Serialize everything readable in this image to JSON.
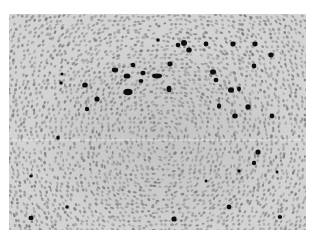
{
  "image": {
    "kind": "grayscale histology micrograph",
    "description": "Tissue section with densely packed small gray nuclei arranged in a roughly circular follicle-like pattern; scattered darkly stained nuclei concentrated in the upper half",
    "frame": {
      "x": 9,
      "y": 14,
      "width": 297,
      "height": 216
    },
    "colors": {
      "border": "#ffffff",
      "background": "#cfcfcf",
      "nucleus_light": "#9a9a9a",
      "nucleus_mid": "#7d7d7d",
      "nucleus_dark": "#111111",
      "scan_line": "#f2f2f2"
    },
    "artifacts": {
      "horizontal_scan_line_y": 140
    },
    "dark_nuclei": [
      [
        115,
        70,
        3.2,
        2.4
      ],
      [
        133,
        65,
        2.4,
        2.2
      ],
      [
        143,
        73,
        2.6,
        2.2
      ],
      [
        141,
        81,
        2.3,
        2.0
      ],
      [
        127,
        76,
        3.4,
        2.6
      ],
      [
        157,
        76,
        5.0,
        2.4
      ],
      [
        169,
        89,
        2.4,
        3.2
      ],
      [
        128,
        92,
        4.6,
        3.2
      ],
      [
        170,
        64,
        2.6,
        2.4
      ],
      [
        189,
        50,
        2.8,
        2.6
      ],
      [
        178,
        45,
        2.4,
        2.2
      ],
      [
        184,
        43,
        3.0,
        3.0
      ],
      [
        206,
        44,
        2.4,
        2.4
      ],
      [
        233,
        44,
        2.6,
        2.4
      ],
      [
        255,
        44,
        2.6,
        2.4
      ],
      [
        271,
        55,
        2.6,
        2.4
      ],
      [
        254,
        66,
        2.4,
        2.4
      ],
      [
        213,
        72,
        3.0,
        2.8
      ],
      [
        216,
        80,
        2.4,
        2.2
      ],
      [
        231,
        90,
        3.0,
        2.8
      ],
      [
        239,
        89,
        2.0,
        2.4
      ],
      [
        219,
        106,
        2.0,
        2.8
      ],
      [
        248,
        107,
        2.6,
        2.8
      ],
      [
        235,
        116,
        2.8,
        2.4
      ],
      [
        272,
        116,
        2.4,
        2.4
      ],
      [
        61,
        83,
        1.8,
        1.8
      ],
      [
        85,
        85,
        2.8,
        2.6
      ],
      [
        97,
        99,
        2.6,
        2.6
      ],
      [
        87,
        109,
        2.2,
        2.2
      ],
      [
        58,
        138,
        1.8,
        2.6
      ],
      [
        62,
        74,
        1.6,
        1.6
      ],
      [
        158,
        40,
        1.8,
        1.8
      ],
      [
        258,
        152,
        2.6,
        2.6
      ],
      [
        254,
        163,
        2.2,
        2.2
      ],
      [
        239,
        171,
        1.8,
        1.8
      ],
      [
        206,
        181,
        1.4,
        1.4
      ],
      [
        229,
        207,
        2.4,
        2.4
      ],
      [
        280,
        217,
        2.2,
        2.0
      ],
      [
        31,
        176,
        1.8,
        1.6
      ],
      [
        67,
        207,
        1.8,
        1.8
      ],
      [
        31,
        218,
        2.6,
        2.2
      ],
      [
        174,
        219,
        2.6,
        2.6
      ],
      [
        277,
        172,
        1.4,
        1.4
      ]
    ]
  }
}
